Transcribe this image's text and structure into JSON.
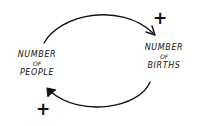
{
  "diagram": {
    "type": "causal-loop",
    "style": "hand-drawn",
    "stroke_color": "#111111",
    "background": "#ffffff",
    "nodes": [
      {
        "id": "people",
        "lines": [
          "NUMBER",
          "OF",
          "PEOPLE"
        ]
      },
      {
        "id": "births",
        "lines": [
          "NUMBER",
          "OF",
          "BIRTHS"
        ]
      }
    ],
    "links": [
      {
        "from": "people",
        "to": "births",
        "polarity": "+"
      },
      {
        "from": "births",
        "to": "people",
        "polarity": "+"
      }
    ]
  }
}
